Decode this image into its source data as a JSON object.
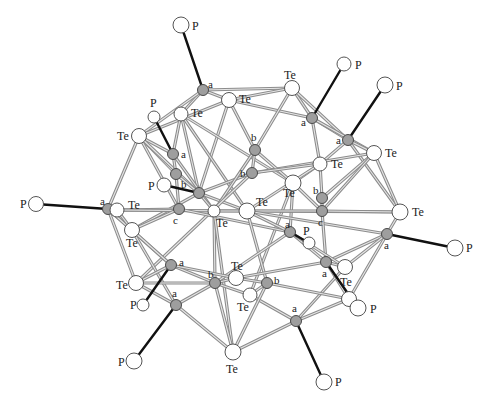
{
  "figure": {
    "colors": {
      "bond_outer": "#8c8c8c",
      "bond_inner": "#e6e6e6",
      "p_bond": "#111111",
      "metal_fill": "#9e9e9e",
      "open_fill": "#ffffff"
    }
  },
  "atoms": [
    {
      "id": "P1",
      "type": "P",
      "x": 181,
      "y": 25,
      "r": 8,
      "label": "P",
      "lx": 192,
      "ly": 30
    },
    {
      "id": "A1",
      "type": "metal",
      "x": 203,
      "y": 90,
      "r": 5.5,
      "label": "a",
      "lx": 208,
      "ly": 88
    },
    {
      "id": "Te1",
      "type": "Te",
      "x": 229,
      "y": 100,
      "r": 7.5,
      "label": "Te",
      "lx": 239,
      "ly": 103
    },
    {
      "id": "Te2",
      "type": "Te",
      "x": 181,
      "y": 114,
      "r": 7,
      "label": "Te",
      "lx": 191,
      "ly": 117
    },
    {
      "id": "P2",
      "type": "P",
      "x": 154,
      "y": 117,
      "r": 6,
      "label": "P",
      "lx": 150,
      "ly": 107
    },
    {
      "id": "Te3",
      "type": "Te",
      "x": 139,
      "y": 136,
      "r": 7.5,
      "label": "Te",
      "lx": 117,
      "ly": 140
    },
    {
      "id": "A2",
      "type": "metal",
      "x": 173,
      "y": 154,
      "r": 5.5,
      "label": "a",
      "lx": 181,
      "ly": 158
    },
    {
      "id": "G1",
      "type": "metal",
      "x": 176,
      "y": 174,
      "r": 5.5,
      "label": "",
      "lx": 0,
      "ly": 0
    },
    {
      "id": "P3",
      "type": "P",
      "x": 164,
      "y": 185,
      "r": 7,
      "label": "P",
      "lx": 148,
      "ly": 190
    },
    {
      "id": "B1",
      "type": "metal",
      "x": 199,
      "y": 193,
      "r": 5.5,
      "label": "b",
      "lx": 181,
      "ly": 188
    },
    {
      "id": "Te4",
      "type": "Te",
      "x": 292,
      "y": 88,
      "r": 7.5,
      "label": "Te",
      "lx": 284,
      "ly": 79
    },
    {
      "id": "P4",
      "type": "P",
      "x": 344,
      "y": 64,
      "r": 7,
      "label": "P",
      "lx": 355,
      "ly": 69
    },
    {
      "id": "A3",
      "type": "metal",
      "x": 312,
      "y": 118,
      "r": 5.5,
      "label": "a",
      "lx": 301,
      "ly": 126
    },
    {
      "id": "P5",
      "type": "P",
      "x": 385,
      "y": 85,
      "r": 8,
      "label": "P",
      "lx": 396,
      "ly": 90
    },
    {
      "id": "A4",
      "type": "metal",
      "x": 348,
      "y": 140,
      "r": 5.5,
      "label": "a",
      "lx": 336,
      "ly": 144
    },
    {
      "id": "Te5",
      "type": "Te",
      "x": 374,
      "y": 153,
      "r": 7.5,
      "label": "Te",
      "lx": 385,
      "ly": 157
    },
    {
      "id": "B2",
      "type": "metal",
      "x": 255,
      "y": 150,
      "r": 5.5,
      "label": "b",
      "lx": 251,
      "ly": 141
    },
    {
      "id": "B3",
      "type": "metal",
      "x": 252,
      "y": 173,
      "r": 5.5,
      "label": "b",
      "lx": 240,
      "ly": 177
    },
    {
      "id": "Te6",
      "type": "Te",
      "x": 320,
      "y": 164,
      "r": 7,
      "label": "Te",
      "lx": 331,
      "ly": 168
    },
    {
      "id": "Te7",
      "type": "Te",
      "x": 293,
      "y": 183,
      "r": 8,
      "label": "Te",
      "lx": 283,
      "ly": 197
    },
    {
      "id": "P6",
      "type": "P",
      "x": 36,
      "y": 204,
      "r": 7.5,
      "label": "P",
      "lx": 20,
      "ly": 208
    },
    {
      "id": "A5",
      "type": "metal",
      "x": 108,
      "y": 209,
      "r": 5.5,
      "label": "a",
      "lx": 100,
      "ly": 205
    },
    {
      "id": "Te8",
      "type": "Te",
      "x": 117,
      "y": 210,
      "r": 7,
      "label": "Te",
      "lx": 128,
      "ly": 209
    },
    {
      "id": "C1",
      "type": "metal",
      "x": 179,
      "y": 209,
      "r": 5.5,
      "label": "c",
      "lx": 173,
      "ly": 224
    },
    {
      "id": "Te9",
      "type": "Te",
      "x": 214,
      "y": 211,
      "r": 6,
      "label": "Te",
      "lx": 216,
      "ly": 227
    },
    {
      "id": "Te10",
      "type": "Te",
      "x": 247,
      "y": 211,
      "r": 8,
      "label": "Te",
      "lx": 256,
      "ly": 206
    },
    {
      "id": "B4",
      "type": "metal",
      "x": 322,
      "y": 198,
      "r": 5.5,
      "label": "b",
      "lx": 313,
      "ly": 194
    },
    {
      "id": "C2",
      "type": "metal",
      "x": 322,
      "y": 211,
      "r": 5.5,
      "label": "c",
      "lx": 318,
      "ly": 226
    },
    {
      "id": "Te11",
      "type": "Te",
      "x": 400,
      "y": 212,
      "r": 8,
      "label": "Te",
      "lx": 412,
      "ly": 216
    },
    {
      "id": "A6",
      "type": "metal",
      "x": 387,
      "y": 234,
      "r": 5.5,
      "label": "a",
      "lx": 384,
      "ly": 249
    },
    {
      "id": "P7",
      "type": "P",
      "x": 455,
      "y": 248,
      "r": 8,
      "label": "P",
      "lx": 466,
      "ly": 252
    },
    {
      "id": "A7",
      "type": "metal",
      "x": 290,
      "y": 232,
      "r": 5.5,
      "label": "a",
      "lx": 285,
      "ly": 228
    },
    {
      "id": "P8",
      "type": "P",
      "x": 309,
      "y": 243,
      "r": 6,
      "label": "P",
      "lx": 303,
      "ly": 235
    },
    {
      "id": "A8",
      "type": "metal",
      "x": 326,
      "y": 262,
      "r": 5.5,
      "label": "a",
      "lx": 322,
      "ly": 277
    },
    {
      "id": "Te12",
      "type": "Te",
      "x": 345,
      "y": 267,
      "r": 7.5,
      "label": "Te",
      "lx": 340,
      "ly": 286
    },
    {
      "id": "Te13",
      "type": "Te",
      "x": 132,
      "y": 230,
      "r": 7.5,
      "label": "Te",
      "lx": 126,
      "ly": 247
    },
    {
      "id": "A9",
      "type": "metal",
      "x": 171,
      "y": 265,
      "r": 5.5,
      "label": "a",
      "lx": 179,
      "ly": 266
    },
    {
      "id": "Te14",
      "type": "Te",
      "x": 136,
      "y": 283,
      "r": 7.5,
      "label": "Te",
      "lx": 116,
      "ly": 289
    },
    {
      "id": "P9",
      "type": "P",
      "x": 143,
      "y": 305,
      "r": 6,
      "label": "P",
      "lx": 130,
      "ly": 309
    },
    {
      "id": "A10",
      "type": "metal",
      "x": 176,
      "y": 305,
      "r": 5.5,
      "label": "a",
      "lx": 172,
      "ly": 297
    },
    {
      "id": "P10",
      "type": "P",
      "x": 134,
      "y": 361,
      "r": 8,
      "label": "P",
      "lx": 118,
      "ly": 366
    },
    {
      "id": "B5",
      "type": "metal",
      "x": 215,
      "y": 283,
      "r": 5.5,
      "label": "b",
      "lx": 208,
      "ly": 278
    },
    {
      "id": "Te15",
      "type": "Te",
      "x": 236,
      "y": 278,
      "r": 7.5,
      "label": "Te",
      "lx": 231,
      "ly": 270
    },
    {
      "id": "Te16",
      "type": "Te",
      "x": 250,
      "y": 295,
      "r": 7,
      "label": "Te",
      "lx": 237,
      "ly": 311
    },
    {
      "id": "B6",
      "type": "metal",
      "x": 267,
      "y": 283,
      "r": 5.5,
      "label": "b",
      "lx": 274,
      "ly": 284
    },
    {
      "id": "Te17",
      "type": "Te",
      "x": 349,
      "y": 299,
      "r": 7.5,
      "label": "Te",
      "lx": 0,
      "ly": 0
    },
    {
      "id": "P11",
      "type": "P",
      "x": 358,
      "y": 308,
      "r": 8,
      "label": "P",
      "lx": 370,
      "ly": 313
    },
    {
      "id": "A11",
      "type": "metal",
      "x": 296,
      "y": 321,
      "r": 5.5,
      "label": "a",
      "lx": 292,
      "ly": 312
    },
    {
      "id": "P12",
      "type": "P",
      "x": 324,
      "y": 382,
      "r": 8,
      "label": "P",
      "lx": 335,
      "ly": 386
    },
    {
      "id": "Te18",
      "type": "Te",
      "x": 233,
      "y": 352,
      "r": 8,
      "label": "Te",
      "lx": 226,
      "ly": 373
    }
  ],
  "p_bonds": [
    [
      "P1",
      "A1"
    ],
    [
      "P2",
      "A2"
    ],
    [
      "P3",
      "B1"
    ],
    [
      "P4",
      "A3"
    ],
    [
      "P5",
      "A4"
    ],
    [
      "P6",
      "A5"
    ],
    [
      "P7",
      "A6"
    ],
    [
      "P8",
      "A7"
    ],
    [
      "P9",
      "A9"
    ],
    [
      "P10",
      "A10"
    ],
    [
      "P11",
      "A8"
    ],
    [
      "P12",
      "A11"
    ]
  ],
  "bonds": [
    [
      "A1",
      "Te1"
    ],
    [
      "A1",
      "Te2"
    ],
    [
      "A1",
      "Te3"
    ],
    [
      "A1",
      "Te4"
    ],
    [
      "A1",
      "Te2"
    ],
    [
      "Te1",
      "Te4"
    ],
    [
      "Te1",
      "A3"
    ],
    [
      "Te1",
      "B2"
    ],
    [
      "Te1",
      "B1"
    ],
    [
      "Te1",
      "Te3"
    ],
    [
      "Te2",
      "A2"
    ],
    [
      "Te2",
      "B1"
    ],
    [
      "Te2",
      "Te10"
    ],
    [
      "Te2",
      "Te7"
    ],
    [
      "Te3",
      "A2"
    ],
    [
      "Te3",
      "G1"
    ],
    [
      "Te3",
      "B1"
    ],
    [
      "Te3",
      "A5"
    ],
    [
      "Te3",
      "C1"
    ],
    [
      "A2",
      "G1"
    ],
    [
      "A2",
      "Te9"
    ],
    [
      "G1",
      "B1"
    ],
    [
      "G1",
      "C1"
    ],
    [
      "B1",
      "Te10"
    ],
    [
      "B1",
      "B3"
    ],
    [
      "B1",
      "Te9"
    ],
    [
      "B1",
      "Te13"
    ],
    [
      "Te4",
      "A3"
    ],
    [
      "Te4",
      "A4"
    ],
    [
      "Te4",
      "B2"
    ],
    [
      "A3",
      "A4"
    ],
    [
      "A3",
      "Te6"
    ],
    [
      "A3",
      "Te5"
    ],
    [
      "A4",
      "Te6"
    ],
    [
      "A4",
      "Te5"
    ],
    [
      "A4",
      "Te11"
    ],
    [
      "Te5",
      "B4"
    ],
    [
      "Te5",
      "C2"
    ],
    [
      "Te5",
      "Te11"
    ],
    [
      "Te5",
      "B3"
    ],
    [
      "B2",
      "B3"
    ],
    [
      "B2",
      "Te7"
    ],
    [
      "B2",
      "Te9"
    ],
    [
      "B3",
      "Te6"
    ],
    [
      "B3",
      "Te14"
    ],
    [
      "Te6",
      "B4"
    ],
    [
      "Te6",
      "Te7"
    ],
    [
      "Te6",
      "Te10"
    ],
    [
      "Te7",
      "C2"
    ],
    [
      "Te7",
      "A7"
    ],
    [
      "Te7",
      "Te16"
    ],
    [
      "A5",
      "Te8"
    ],
    [
      "A5",
      "Te13"
    ],
    [
      "A5",
      "Te14"
    ],
    [
      "A5",
      "A9"
    ],
    [
      "Te8",
      "C1"
    ],
    [
      "Te8",
      "Te9"
    ],
    [
      "Te8",
      "Te10"
    ],
    [
      "Te8",
      "Te13"
    ],
    [
      "C1",
      "Te13"
    ],
    [
      "C1",
      "A7"
    ],
    [
      "Te9",
      "Te10"
    ],
    [
      "Te9",
      "B5"
    ],
    [
      "Te9",
      "Te18"
    ],
    [
      "Te10",
      "Te11"
    ],
    [
      "Te10",
      "C2"
    ],
    [
      "Te10",
      "A7"
    ],
    [
      "Te10",
      "B6"
    ],
    [
      "Te10",
      "A6"
    ],
    [
      "B4",
      "C2"
    ],
    [
      "C2",
      "A8"
    ],
    [
      "C2",
      "Te11"
    ],
    [
      "Te11",
      "A6"
    ],
    [
      "A6",
      "A8"
    ],
    [
      "A6",
      "Te12"
    ],
    [
      "A6",
      "Te17"
    ],
    [
      "A7",
      "A8"
    ],
    [
      "A7",
      "B5"
    ],
    [
      "A7",
      "Te12"
    ],
    [
      "A8",
      "Te12"
    ],
    [
      "A8",
      "Te15"
    ],
    [
      "A8",
      "Te17"
    ],
    [
      "Te12",
      "A11"
    ],
    [
      "Te13",
      "A9"
    ],
    [
      "Te13",
      "A10"
    ],
    [
      "A9",
      "Te14"
    ],
    [
      "A9",
      "B5"
    ],
    [
      "A9",
      "Te15"
    ],
    [
      "Te14",
      "B5"
    ],
    [
      "Te14",
      "A10"
    ],
    [
      "A10",
      "B5"
    ],
    [
      "A10",
      "Te18"
    ],
    [
      "B5",
      "Te15"
    ],
    [
      "B5",
      "Te16"
    ],
    [
      "B5",
      "Te18"
    ],
    [
      "Te15",
      "B6"
    ],
    [
      "Te16",
      "B6"
    ],
    [
      "Te16",
      "A11"
    ],
    [
      "B6",
      "Te17"
    ],
    [
      "B6",
      "Te18"
    ],
    [
      "Te17",
      "A11"
    ],
    [
      "A11",
      "Te18"
    ]
  ]
}
